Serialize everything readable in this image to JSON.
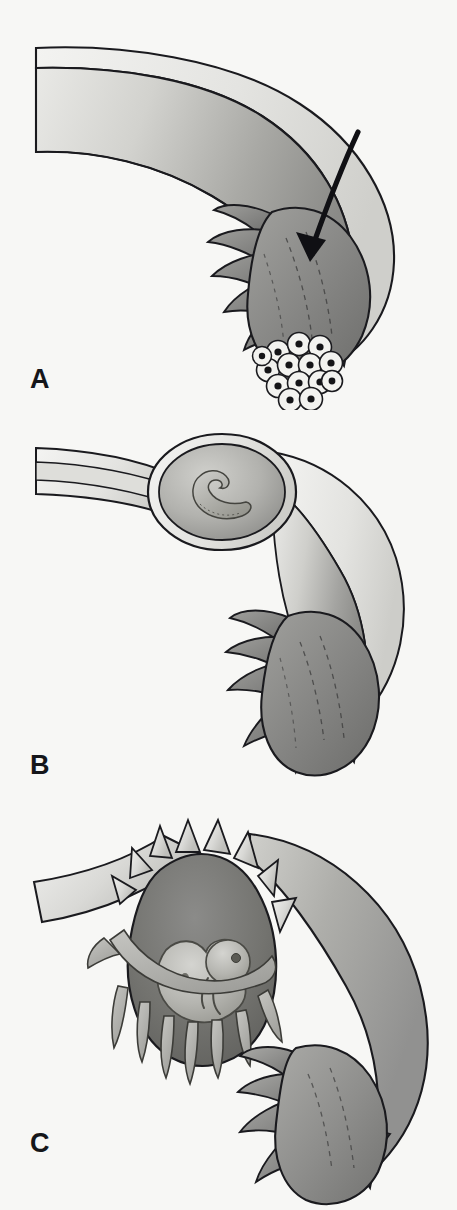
{
  "figure": {
    "background_color": "#f7f7f5",
    "line_color": "#1a1a1e",
    "width": 457,
    "height": 1210
  },
  "palette": {
    "outline": "#1a1a1e",
    "serosa_light": "#ededea",
    "lumen_light": "#d5d5d1",
    "tube_mid": "#b9b9b5",
    "tube_dark": "#8d8d8a",
    "fimbria_gray": "#8e8e8b",
    "fimbria_dark": "#6f6f6d",
    "cavity_dark": "#6b6b69",
    "embryo_fill": "#a9a9a6",
    "morula_cell": "#f2f2ef",
    "morula_nucleus": "#141417",
    "arrow": "#101014"
  },
  "panels": [
    {
      "id": "A",
      "label": "A",
      "caption": "Fertilized ovum (morula) at the fimbriated end of the fallopian tube",
      "structures": [
        {
          "name": "fallopian-tube",
          "description": "Curved tube with thin serosal wall and light lumen, darkening distally"
        },
        {
          "name": "fimbriae",
          "description": "Finger-like projections fanning from the infundibulum"
        },
        {
          "name": "morula",
          "description": "Cluster of dividing cells entering the tube"
        },
        {
          "name": "direction-arrow",
          "description": "Curved arrow showing travel of the ovum toward the uterus"
        }
      ],
      "morula": {
        "cell_count": 16,
        "cell_fill": "#f2f2ef",
        "nucleus_fill": "#141417"
      },
      "arrow": {
        "direction": "down-left",
        "color": "#101014"
      }
    },
    {
      "id": "B",
      "label": "B",
      "caption": "Implanted embryo distending the ampulla of the tube",
      "structures": [
        {
          "name": "fallopian-tube",
          "description": "Tube with an ovoid swelling in its course"
        },
        {
          "name": "tubal-swelling",
          "description": "Ovoid dilation of the tube wall containing the gestation"
        },
        {
          "name": "embryo",
          "description": "Small C-shaped embryo within the distended segment"
        },
        {
          "name": "fimbriae",
          "description": "Finger-like projections at the distal end"
        }
      ],
      "embryo": {
        "stage": "early",
        "shape": "curved C"
      }
    },
    {
      "id": "C",
      "label": "C",
      "caption": "Tubal rupture with the fetus and chorionic villi escaping through the torn wall",
      "structures": [
        {
          "name": "ruptured-tube",
          "description": "Torn tube wall with jagged spiked edges"
        },
        {
          "name": "rupture-cavity",
          "description": "Dark gestational cavity exposed by the tear"
        },
        {
          "name": "fetus",
          "description": "Curled fetus with head, limb buds and eye visible"
        },
        {
          "name": "chorionic-villi",
          "description": "Finger-like villi hanging from the torn site"
        },
        {
          "name": "fimbriae",
          "description": "Fimbriae at the distal end of the tube"
        }
      ],
      "fetus": {
        "stage": "late embryonic",
        "features": [
          "head",
          "eye",
          "limb buds",
          "curled trunk"
        ]
      }
    }
  ]
}
